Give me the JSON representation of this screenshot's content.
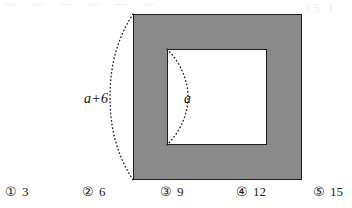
{
  "figure": {
    "outer_square": {
      "name": "shaded-outer-square",
      "fill_color": "#8a8a8a",
      "border_color": "#1f1f1f",
      "side_label": "a+6"
    },
    "inner_square": {
      "name": "white-inner-square",
      "fill_color": "#ffffff",
      "border_color": "#1f1f1f",
      "side_label": "a"
    },
    "arcs": {
      "outer_arc_label": "a+6",
      "inner_arc_label": "a",
      "style": "dotted"
    }
  },
  "choices": [
    {
      "marker": "①",
      "value": "3"
    },
    {
      "marker": "②",
      "value": "6"
    },
    {
      "marker": "③",
      "value": "9"
    },
    {
      "marker": "④",
      "value": "12"
    },
    {
      "marker": "⑤",
      "value": "15"
    }
  ],
  "artifacts": {
    "top_left": "― ― ― ― ― ―",
    "top_right": "15 1"
  }
}
